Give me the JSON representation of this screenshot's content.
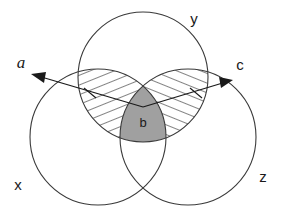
{
  "figure": {
    "type": "venn-diagram",
    "width": 287,
    "height": 223,
    "background_color": "#ffffff",
    "outline_color": "#3a3a3a",
    "shade_color": "#a0a0a0",
    "hatch_color": "#1a1a1a"
  },
  "sets": [
    {
      "id": "x",
      "label": "x",
      "position": "bottom-left",
      "center_x": 98,
      "center_y": 137,
      "radius": 68,
      "label_x": 18,
      "label_y": 190
    },
    {
      "id": "y",
      "label": "y",
      "position": "top-center",
      "center_x": 143,
      "center_y": 77,
      "radius": 65,
      "label_x": 194,
      "label_y": 24
    },
    {
      "id": "z",
      "label": "z",
      "position": "bottom-right",
      "center_x": 188,
      "center_y": 137,
      "radius": 68,
      "label_x": 263,
      "label_y": 182
    }
  ],
  "regions": [
    {
      "id": "xy-lens",
      "label": "",
      "style": "hatched",
      "description": "x intersect y, excluding center",
      "hatch_direction": "up-right"
    },
    {
      "id": "yz-lens",
      "label": "",
      "style": "hatched",
      "description": "y intersect z, excluding center",
      "hatch_direction": "down-right"
    },
    {
      "id": "xyz-center",
      "label": "b",
      "style": "solid-gray",
      "description": "x intersect y intersect z",
      "label_x": 143,
      "label_y": 127
    }
  ],
  "arrows": [
    {
      "id": "arrow-a",
      "label": "a",
      "label_x": 21,
      "label_y": 68,
      "tail_x": 143,
      "tail_y": 107,
      "tip_x": 31,
      "tip_y": 74,
      "direction": "up-left",
      "tick_x": 90,
      "tick_y": 93
    },
    {
      "id": "arrow-c",
      "label": "c",
      "label_x": 240,
      "label_y": 70,
      "tail_x": 143,
      "tail_y": 107,
      "tip_x": 233,
      "tip_y": 80,
      "direction": "up-right",
      "tick_x": 196,
      "tick_y": 93
    }
  ],
  "labels": {
    "set_x": "x",
    "set_y": "y",
    "set_z": "z",
    "region_b": "b",
    "arrow_a": "a",
    "arrow_c": "c"
  }
}
